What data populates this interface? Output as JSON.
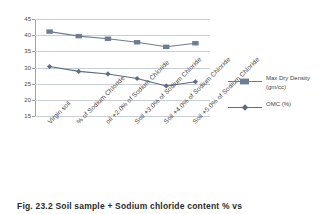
{
  "chart_data": {
    "type": "line",
    "title": "",
    "xlabel": "",
    "ylabel": "",
    "ylim": [
      15,
      45
    ],
    "yticks": [
      15,
      20,
      25,
      30,
      35,
      40,
      45
    ],
    "grid": true,
    "legend_position": "right",
    "categories": [
      "Virgin soil",
      "% of Sodium Chloride",
      "oil +2.0% of Sodium Chloride",
      "Soil +3.0% of Sodium Chloride",
      "Soil +4.0% of Sodium Chloride",
      "Soil +5.0% of Sodium Chloride"
    ],
    "series": [
      {
        "name": "Max Dry Density (gm/cc)",
        "marker": "square",
        "color": "#6b7c93",
        "values": [
          41.1,
          39.7,
          38.9,
          37.8,
          36.4,
          37.5
        ]
      },
      {
        "name": "OMC (%)",
        "marker": "diamond",
        "color": "#5b6c83",
        "values": [
          30.3,
          28.8,
          28.0,
          26.6,
          24.3,
          25.6
        ]
      }
    ]
  },
  "legend": {
    "items": [
      {
        "line1": "Max Dry Density",
        "line2": "(gm/cc)"
      },
      {
        "line1": "OMC (%)",
        "line2": ""
      }
    ]
  },
  "caption": {
    "number": "Fig. 23.2",
    "text": "Soil sample + Sodium chloride content % vs"
  },
  "colors": {
    "series_primary": "#6b7c93",
    "series_secondary": "#5b6c83",
    "grid": "#c9cfd6",
    "axis": "#9aa3ac",
    "text": "#3f3f3f"
  }
}
